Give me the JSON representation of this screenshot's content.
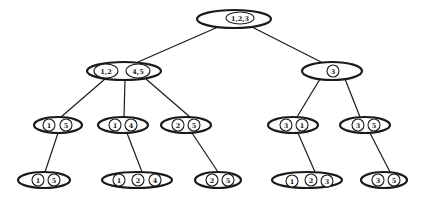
{
  "diagram": {
    "type": "tree",
    "colors": {
      "stroke": "#1a1a1a",
      "background": "#ffffff"
    },
    "nodes": [
      {
        "id": "root",
        "cx": 234,
        "cy": 19,
        "rx": 37,
        "ry": 9,
        "items": [
          {
            "label": "1,2,3",
            "cx": 240,
            "cy": 18,
            "rx": 14,
            "ry": 6
          }
        ]
      },
      {
        "id": "n12_45",
        "cx": 124,
        "cy": 71,
        "rx": 37,
        "ry": 9,
        "items": [
          {
            "label": "1,2",
            "cx": 106,
            "cy": 71,
            "rx": 12,
            "ry": 7
          },
          {
            "label": "4,5",
            "cx": 138,
            "cy": 71,
            "rx": 12,
            "ry": 7
          }
        ]
      },
      {
        "id": "n3",
        "cx": 332,
        "cy": 71,
        "rx": 30,
        "ry": 9,
        "items": [
          {
            "label": "3",
            "cx": 333,
            "cy": 71,
            "rx": 6,
            "ry": 6
          }
        ]
      },
      {
        "id": "n15",
        "cx": 58,
        "cy": 125,
        "rx": 24,
        "ry": 8,
        "items": [
          {
            "label": "1",
            "cx": 49,
            "cy": 125,
            "rx": 6,
            "ry": 6
          },
          {
            "label": "5",
            "cx": 66,
            "cy": 125,
            "rx": 6,
            "ry": 6
          }
        ]
      },
      {
        "id": "n14",
        "cx": 123,
        "cy": 125,
        "rx": 25,
        "ry": 8,
        "items": [
          {
            "label": "1",
            "cx": 115,
            "cy": 125,
            "rx": 6,
            "ry": 6
          },
          {
            "label": "4",
            "cx": 131,
            "cy": 125,
            "rx": 6,
            "ry": 6
          }
        ]
      },
      {
        "id": "n25",
        "cx": 186,
        "cy": 125,
        "rx": 25,
        "ry": 8,
        "items": [
          {
            "label": "2",
            "cx": 178,
            "cy": 125,
            "rx": 6,
            "ry": 6
          },
          {
            "label": "5",
            "cx": 194,
            "cy": 125,
            "rx": 6,
            "ry": 6
          }
        ]
      },
      {
        "id": "n31",
        "cx": 293,
        "cy": 125,
        "rx": 25,
        "ry": 8,
        "items": [
          {
            "label": "3",
            "cx": 286,
            "cy": 125,
            "rx": 6,
            "ry": 6
          },
          {
            "label": "1",
            "cx": 302,
            "cy": 125,
            "rx": 6,
            "ry": 6
          }
        ]
      },
      {
        "id": "n35",
        "cx": 365,
        "cy": 125,
        "rx": 25,
        "ry": 8,
        "items": [
          {
            "label": "3",
            "cx": 358,
            "cy": 125,
            "rx": 6,
            "ry": 6
          },
          {
            "label": "5",
            "cx": 374,
            "cy": 125,
            "rx": 6,
            "ry": 6
          }
        ]
      },
      {
        "id": "n15b",
        "cx": 44,
        "cy": 180,
        "rx": 26,
        "ry": 8,
        "items": [
          {
            "label": "1",
            "cx": 38,
            "cy": 180,
            "rx": 6,
            "ry": 6
          },
          {
            "label": "5",
            "cx": 54,
            "cy": 180,
            "rx": 6,
            "ry": 6
          }
        ]
      },
      {
        "id": "n124",
        "cx": 137,
        "cy": 180,
        "rx": 35,
        "ry": 8,
        "items": [
          {
            "label": "1",
            "cx": 119,
            "cy": 180,
            "rx": 6,
            "ry": 6
          },
          {
            "label": "2",
            "cx": 138,
            "cy": 180,
            "rx": 6,
            "ry": 6
          },
          {
            "label": "4",
            "cx": 155,
            "cy": 180,
            "rx": 6,
            "ry": 6
          }
        ]
      },
      {
        "id": "n25b",
        "cx": 218,
        "cy": 180,
        "rx": 23,
        "ry": 8,
        "items": [
          {
            "label": "2",
            "cx": 212,
            "cy": 180,
            "rx": 6,
            "ry": 6
          },
          {
            "label": "5",
            "cx": 228,
            "cy": 180,
            "rx": 6,
            "ry": 6
          }
        ]
      },
      {
        "id": "n123",
        "cx": 307,
        "cy": 180,
        "rx": 35,
        "ry": 8,
        "items": [
          {
            "label": "1",
            "cx": 292,
            "cy": 181,
            "rx": 6,
            "ry": 6
          },
          {
            "label": "2",
            "cx": 311,
            "cy": 180,
            "rx": 6,
            "ry": 6
          },
          {
            "label": "3",
            "cx": 327,
            "cy": 181,
            "rx": 6,
            "ry": 6
          }
        ]
      },
      {
        "id": "n35b",
        "cx": 384,
        "cy": 180,
        "rx": 23,
        "ry": 8,
        "items": [
          {
            "label": "3",
            "cx": 378,
            "cy": 180,
            "rx": 6,
            "ry": 6
          },
          {
            "label": "5",
            "cx": 394,
            "cy": 180,
            "rx": 6,
            "ry": 6
          }
        ]
      }
    ],
    "edges": [
      {
        "from": "root",
        "to": "n12_45",
        "x1": 218,
        "y1": 27,
        "x2": 138,
        "y2": 62
      },
      {
        "from": "root",
        "to": "n3",
        "x1": 252,
        "y1": 27,
        "x2": 323,
        "y2": 63
      },
      {
        "from": "n12_45",
        "to": "n15",
        "x1": 105,
        "y1": 79,
        "x2": 61,
        "y2": 117
      },
      {
        "from": "n12_45",
        "to": "n14",
        "x1": 125,
        "y1": 80,
        "x2": 124,
        "y2": 117
      },
      {
        "from": "n12_45",
        "to": "n25",
        "x1": 146,
        "y1": 79,
        "x2": 190,
        "y2": 117
      },
      {
        "from": "n3",
        "to": "n31",
        "x1": 320,
        "y1": 79,
        "x2": 297,
        "y2": 117
      },
      {
        "from": "n3",
        "to": "n35",
        "x1": 345,
        "y1": 79,
        "x2": 360,
        "y2": 117
      },
      {
        "from": "n15",
        "to": "n15b",
        "x1": 58,
        "y1": 133,
        "x2": 45,
        "y2": 172
      },
      {
        "from": "n14",
        "to": "n124",
        "x1": 127,
        "y1": 133,
        "x2": 142,
        "y2": 172
      },
      {
        "from": "n25",
        "to": "n25b",
        "x1": 192,
        "y1": 133,
        "x2": 218,
        "y2": 172
      },
      {
        "from": "n31",
        "to": "n123",
        "x1": 298,
        "y1": 133,
        "x2": 315,
        "y2": 172
      },
      {
        "from": "n35",
        "to": "n35b",
        "x1": 370,
        "y1": 133,
        "x2": 390,
        "y2": 172
      }
    ]
  }
}
